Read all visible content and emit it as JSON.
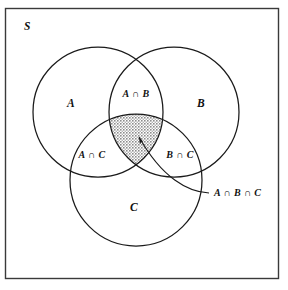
{
  "figure": {
    "type": "venn-diagram-3-set",
    "background_color": "#ffffff",
    "stroke_color": "#1a1a1a",
    "shade_color": "#9a9a9a",
    "shade_style": "stipple-hatch"
  },
  "universe": {
    "label": "S",
    "rect": {
      "x": 5,
      "y": 8,
      "width": 274,
      "height": 271
    },
    "label_pos": {
      "x": 24,
      "y": 30
    }
  },
  "sets": [
    {
      "id": "A",
      "label": "A",
      "cx": 98,
      "cy": 112,
      "r": 65,
      "label_pos": {
        "x": 71,
        "y": 107
      }
    },
    {
      "id": "B",
      "label": "B",
      "cx": 174,
      "cy": 112,
      "r": 65,
      "label_pos": {
        "x": 201,
        "y": 107
      }
    },
    {
      "id": "C",
      "label": "C",
      "cx": 136,
      "cy": 180,
      "r": 66,
      "label_pos": {
        "x": 134,
        "y": 211
      }
    }
  ],
  "regions": [
    {
      "id": "A-inter-B",
      "label": "A ∩ B",
      "label_pos": {
        "x": 136,
        "y": 97
      },
      "shaded": false
    },
    {
      "id": "A-inter-C",
      "label": "A ∩ C",
      "label_pos": {
        "x": 92,
        "y": 158
      },
      "shaded": false
    },
    {
      "id": "B-inter-C",
      "label": "B ∩ C",
      "label_pos": {
        "x": 180,
        "y": 158
      },
      "shaded": false
    },
    {
      "id": "A-inter-B-inter-C",
      "label": "A ∩ B ∩ C",
      "label_pos": {
        "x": 215,
        "y": 196
      },
      "shaded": true
    }
  ],
  "callout": {
    "label": "A ∩ B ∩ C",
    "arrow_tip": {
      "x": 139,
      "y": 136
    },
    "anchor": {
      "x": 212,
      "y": 193
    },
    "describes_region": "A-inter-B-inter-C"
  }
}
